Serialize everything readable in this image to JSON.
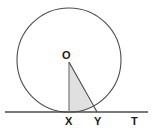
{
  "figure": {
    "kind": "geometry-diagram",
    "width": 155,
    "height": 134,
    "background_color": "#ffffff",
    "stroke_color": "#4d4d4d",
    "label_color": "#1a1a1a",
    "shaded_fill_color": "#e0e0e0",
    "shaded_stroke_color": "#808080"
  },
  "labels": {
    "center": "O",
    "tangent_point": "X",
    "intersection": "Y",
    "line_end": "T"
  },
  "geometry": {
    "circle": {
      "cx": 69,
      "cy": 60,
      "r": 52
    },
    "tangent_line": {
      "x1": 5,
      "y1": 112,
      "x2": 148,
      "y2": 112
    },
    "radius_OX": {
      "x1": 69,
      "y1": 62,
      "x2": 69,
      "y2": 112
    },
    "segment_OY": {
      "x1": 69,
      "y1": 62,
      "x2": 97,
      "y2": 112
    },
    "points": {
      "O": {
        "x": 69,
        "y": 60
      },
      "X": {
        "x": 69,
        "y": 112
      },
      "Y": {
        "x": 97,
        "y": 112
      },
      "T": {
        "x": 134,
        "y": 112
      }
    },
    "label_positions": {
      "O": {
        "left": 62,
        "top": 50
      },
      "X": {
        "left": 65,
        "top": 116
      },
      "Y": {
        "left": 94,
        "top": 116
      },
      "T": {
        "left": 131,
        "top": 116
      }
    }
  }
}
